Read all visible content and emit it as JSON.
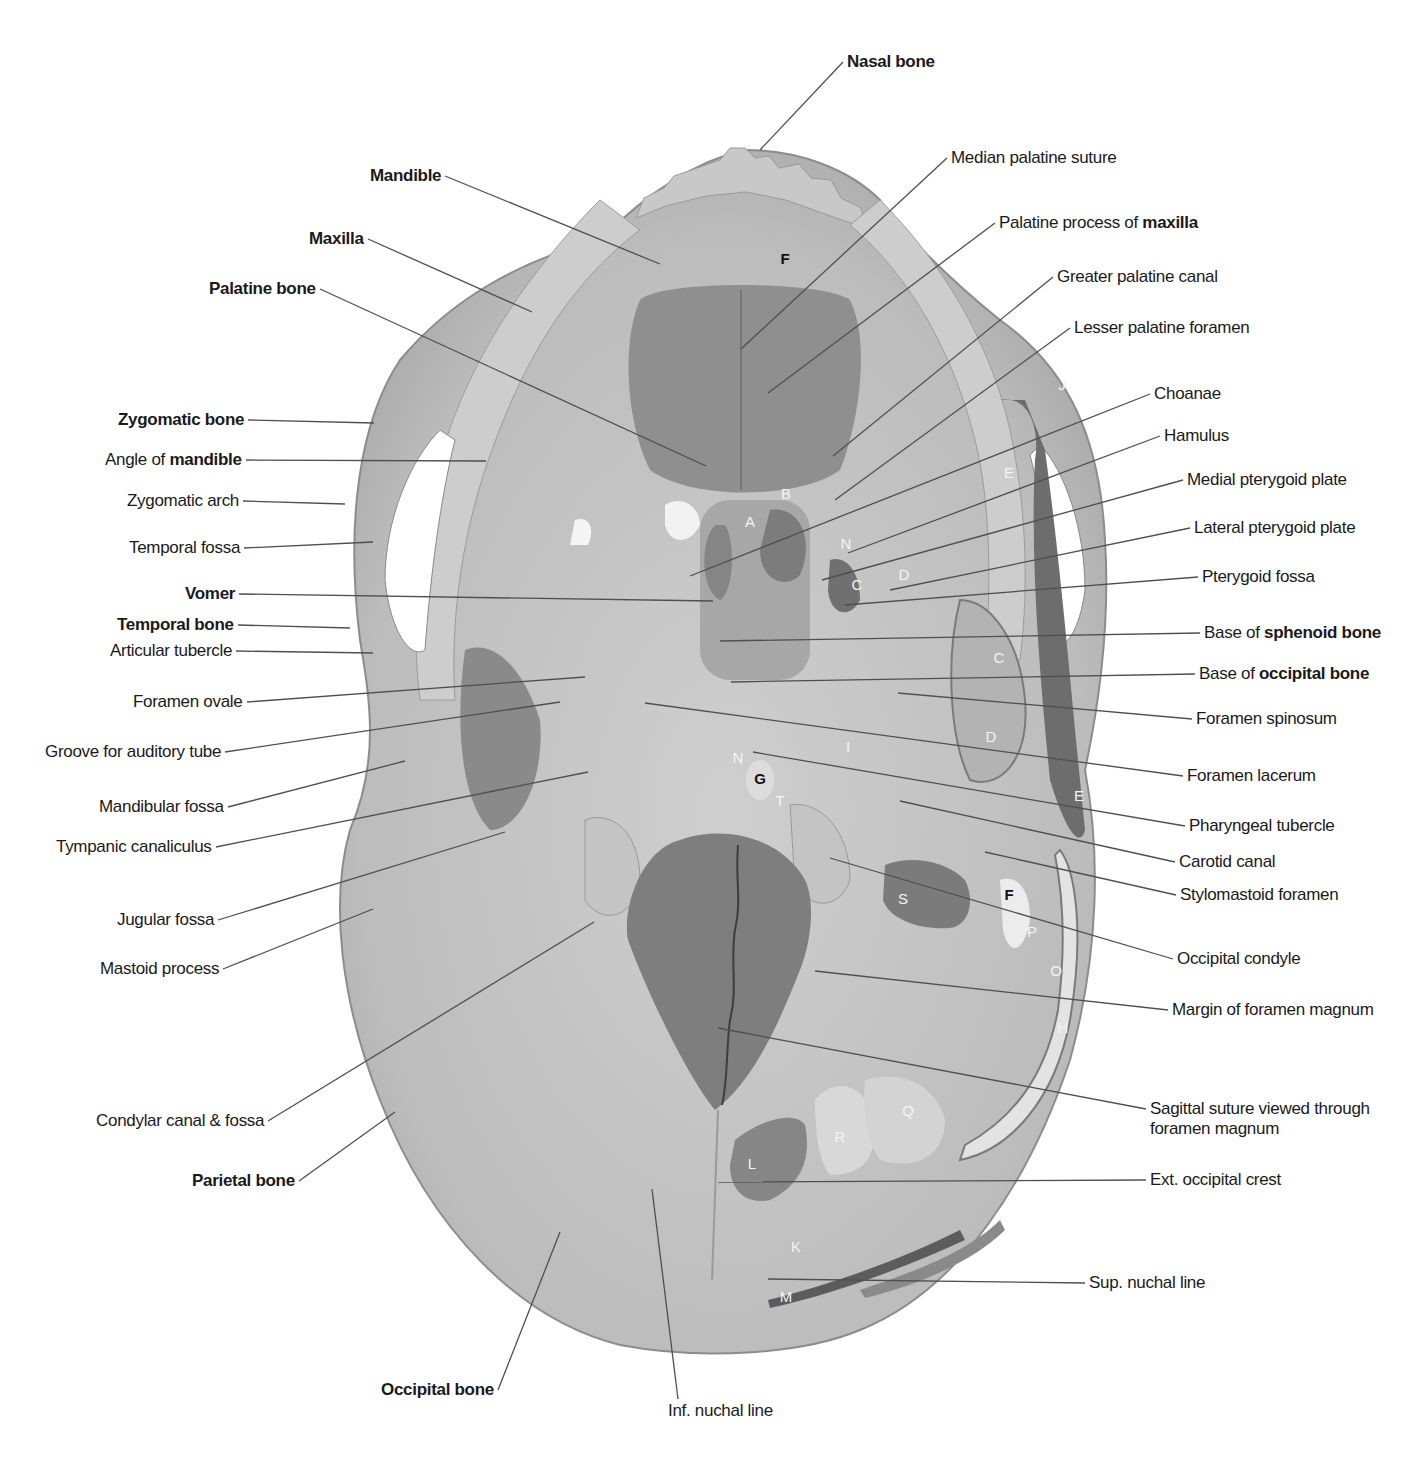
{
  "figure": {
    "colors": {
      "bone": "#bdbdbd",
      "bone_light": "#d2d2d2",
      "shadow": "#8a8a8a",
      "dark_region": "#6e6e6e",
      "leader_line": "#555555"
    }
  },
  "labels_left": [
    {
      "id": "mandible",
      "pre": "",
      "bold": "Mandible",
      "post": "",
      "x": 445,
      "y": 176,
      "tx": 660,
      "ty": 264
    },
    {
      "id": "maxilla",
      "pre": "",
      "bold": "Maxilla",
      "post": "",
      "x": 368,
      "y": 239,
      "tx": 532,
      "ty": 312
    },
    {
      "id": "palatine-bone",
      "pre": "",
      "bold": "Palatine bone",
      "post": "",
      "x": 320,
      "y": 289,
      "tx": 706,
      "ty": 466
    },
    {
      "id": "zygomatic-bone",
      "pre": "",
      "bold": "Zygomatic bone",
      "post": "",
      "x": 248,
      "y": 420,
      "tx": 374,
      "ty": 423
    },
    {
      "id": "angle-of-mandible",
      "pre": "Angle of ",
      "bold": "mandible",
      "post": "",
      "x": 246,
      "y": 460,
      "tx": 486,
      "ty": 461
    },
    {
      "id": "zygomatic-arch",
      "pre": "Zygomatic arch",
      "bold": "",
      "post": "",
      "x": 243,
      "y": 501,
      "tx": 345,
      "ty": 504
    },
    {
      "id": "temporal-fossa",
      "pre": "Temporal fossa",
      "bold": "",
      "post": "",
      "x": 244,
      "y": 548,
      "tx": 373,
      "ty": 542
    },
    {
      "id": "vomer",
      "pre": "",
      "bold": "Vomer",
      "post": "",
      "x": 239,
      "y": 594,
      "tx": 713,
      "ty": 601
    },
    {
      "id": "temporal-bone",
      "pre": "",
      "bold": "Temporal bone",
      "post": "",
      "x": 238,
      "y": 625,
      "tx": 350,
      "ty": 628
    },
    {
      "id": "articular-tubercle",
      "pre": "Articular tubercle",
      "bold": "",
      "post": "",
      "x": 236,
      "y": 651,
      "tx": 373,
      "ty": 653
    },
    {
      "id": "foramen-ovale",
      "pre": "Foramen ovale",
      "bold": "",
      "post": "",
      "x": 247,
      "y": 702,
      "tx": 585,
      "ty": 677
    },
    {
      "id": "groove-auditory-tube",
      "pre": "Groove for auditory tube",
      "bold": "",
      "post": "",
      "x": 225,
      "y": 752,
      "tx": 560,
      "ty": 702
    },
    {
      "id": "mandibular-fossa",
      "pre": "Mandibular fossa",
      "bold": "",
      "post": "",
      "x": 228,
      "y": 807,
      "tx": 405,
      "ty": 761
    },
    {
      "id": "tympanic-canaliculus",
      "pre": "Tympanic canaliculus",
      "bold": "",
      "post": "",
      "x": 216,
      "y": 847,
      "tx": 588,
      "ty": 772
    },
    {
      "id": "jugular-fossa",
      "pre": "Jugular fossa",
      "bold": "",
      "post": "",
      "x": 218,
      "y": 920,
      "tx": 505,
      "ty": 832
    },
    {
      "id": "mastoid-process",
      "pre": "Mastoid process",
      "bold": "",
      "post": "",
      "x": 223,
      "y": 969,
      "tx": 373,
      "ty": 909
    },
    {
      "id": "condylar-canal-fossa",
      "pre": "Condylar canal & fossa",
      "bold": "",
      "post": "",
      "x": 268,
      "y": 1121,
      "tx": 594,
      "ty": 922
    },
    {
      "id": "parietal-bone",
      "pre": "",
      "bold": "Parietal bone",
      "post": "",
      "x": 299,
      "y": 1181,
      "tx": 395,
      "ty": 1112
    },
    {
      "id": "occipital-bone",
      "pre": "",
      "bold": "Occipital bone",
      "post": "",
      "x": 498,
      "y": 1390,
      "tx": 560,
      "ty": 1232
    }
  ],
  "labels_right": [
    {
      "id": "nasal-bone",
      "pre": "",
      "bold": "Nasal bone",
      "post": "",
      "x": 843,
      "y": 62,
      "tx": 760,
      "ty": 150
    },
    {
      "id": "median-palatine-suture",
      "pre": "Median palatine suture",
      "bold": "",
      "post": "",
      "x": 947,
      "y": 158,
      "tx": 741,
      "ty": 349
    },
    {
      "id": "palatine-process-maxilla",
      "pre": "Palatine process of ",
      "bold": "maxilla",
      "post": "",
      "x": 995,
      "y": 223,
      "tx": 768,
      "ty": 393
    },
    {
      "id": "greater-palatine-canal",
      "pre": "Greater palatine canal",
      "bold": "",
      "post": "",
      "x": 1053,
      "y": 277,
      "tx": 833,
      "ty": 456
    },
    {
      "id": "lesser-palatine-foramen",
      "pre": "Lesser palatine foramen",
      "bold": "",
      "post": "",
      "x": 1070,
      "y": 328,
      "tx": 835,
      "ty": 500
    },
    {
      "id": "choanae",
      "pre": "Choanae",
      "bold": "",
      "post": "",
      "x": 1150,
      "y": 394,
      "tx": 690,
      "ty": 576
    },
    {
      "id": "hamulus",
      "pre": "Hamulus",
      "bold": "",
      "post": "",
      "x": 1160,
      "y": 436,
      "tx": 848,
      "ty": 553
    },
    {
      "id": "medial-pterygoid-plate",
      "pre": "Medial pterygoid plate",
      "bold": "",
      "post": "",
      "x": 1183,
      "y": 480,
      "tx": 822,
      "ty": 580
    },
    {
      "id": "lateral-pterygoid-plate",
      "pre": "Lateral pterygoid plate",
      "bold": "",
      "post": "",
      "x": 1190,
      "y": 528,
      "tx": 890,
      "ty": 590
    },
    {
      "id": "pterygoid-fossa",
      "pre": "Pterygoid fossa",
      "bold": "",
      "post": "",
      "x": 1198,
      "y": 577,
      "tx": 845,
      "ty": 605
    },
    {
      "id": "base-sphenoid",
      "pre": "Base of ",
      "bold": "sphenoid bone",
      "post": "",
      "x": 1200,
      "y": 633,
      "tx": 720,
      "ty": 641
    },
    {
      "id": "base-occipital",
      "pre": "Base of ",
      "bold": "occipital bone",
      "post": "",
      "x": 1195,
      "y": 674,
      "tx": 731,
      "ty": 682
    },
    {
      "id": "foramen-spinosum",
      "pre": "Foramen spinosum",
      "bold": "",
      "post": "",
      "x": 1192,
      "y": 719,
      "tx": 898,
      "ty": 693
    },
    {
      "id": "foramen-lacerum",
      "pre": "Foramen lacerum",
      "bold": "",
      "post": "",
      "x": 1183,
      "y": 776,
      "tx": 645,
      "ty": 703
    },
    {
      "id": "pharyngeal-tubercle",
      "pre": "Pharyngeal tubercle",
      "bold": "",
      "post": "",
      "x": 1185,
      "y": 826,
      "tx": 753,
      "ty": 752
    },
    {
      "id": "carotid-canal",
      "pre": "Carotid canal",
      "bold": "",
      "post": "",
      "x": 1175,
      "y": 862,
      "tx": 900,
      "ty": 801
    },
    {
      "id": "stylomastoid-foramen",
      "pre": "Stylomastoid foramen",
      "bold": "",
      "post": "",
      "x": 1176,
      "y": 895,
      "tx": 985,
      "ty": 852
    },
    {
      "id": "occipital-condyle",
      "pre": "Occipital condyle",
      "bold": "",
      "post": "",
      "x": 1173,
      "y": 959,
      "tx": 830,
      "ty": 858
    },
    {
      "id": "margin-foramen-magnum",
      "pre": "Margin of foramen magnum",
      "bold": "",
      "post": "",
      "x": 1168,
      "y": 1010,
      "tx": 815,
      "ty": 971
    },
    {
      "id": "sagittal-suture",
      "pre": "Sagittal suture viewed through",
      "bold": "",
      "post": "foramen magnum",
      "x": 1146,
      "y": 1109,
      "tx": 718,
      "ty": 1028
    },
    {
      "id": "ext-occipital-crest",
      "pre": "Ext. occipital crest",
      "bold": "",
      "post": "",
      "x": 1146,
      "y": 1180,
      "tx": 718,
      "ty": 1182
    },
    {
      "id": "sup-nuchal-line",
      "pre": "Sup. nuchal line",
      "bold": "",
      "post": "",
      "x": 1085,
      "y": 1283,
      "tx": 768,
      "ty": 1279
    }
  ],
  "labels_bottom": [
    {
      "id": "inf-nuchal-line",
      "pre": "Inf. nuchal line",
      "bold": "",
      "post": "",
      "x": 668,
      "y": 1411,
      "tx": 652,
      "ty": 1189
    }
  ],
  "region_letters": [
    {
      "letter": "F",
      "x": 785,
      "y": 258,
      "dark": true
    },
    {
      "letter": "J",
      "x": 1062,
      "y": 384,
      "dark": false
    },
    {
      "letter": "E",
      "x": 1009,
      "y": 472,
      "dark": false
    },
    {
      "letter": "B",
      "x": 786,
      "y": 493,
      "dark": false
    },
    {
      "letter": "A",
      "x": 750,
      "y": 521,
      "dark": false
    },
    {
      "letter": "N",
      "x": 846,
      "y": 543,
      "dark": false
    },
    {
      "letter": "D",
      "x": 904,
      "y": 574,
      "dark": false
    },
    {
      "letter": "C",
      "x": 857,
      "y": 584,
      "dark": false
    },
    {
      "letter": "C",
      "x": 999,
      "y": 657,
      "dark": false
    },
    {
      "letter": "D",
      "x": 991,
      "y": 736,
      "dark": false
    },
    {
      "letter": "I",
      "x": 848,
      "y": 746,
      "dark": false
    },
    {
      "letter": "N",
      "x": 738,
      "y": 757,
      "dark": false
    },
    {
      "letter": "G",
      "x": 760,
      "y": 778,
      "dark": true
    },
    {
      "letter": "T",
      "x": 780,
      "y": 800,
      "dark": false
    },
    {
      "letter": "E",
      "x": 1079,
      "y": 795,
      "dark": false
    },
    {
      "letter": "S",
      "x": 903,
      "y": 898,
      "dark": false
    },
    {
      "letter": "F",
      "x": 1009,
      "y": 894,
      "dark": true
    },
    {
      "letter": "P",
      "x": 1032,
      "y": 931,
      "dark": false
    },
    {
      "letter": "O",
      "x": 1056,
      "y": 970,
      "dark": false
    },
    {
      "letter": "H",
      "x": 1063,
      "y": 1027,
      "dark": false
    },
    {
      "letter": "Q",
      "x": 908,
      "y": 1110,
      "dark": false
    },
    {
      "letter": "R",
      "x": 840,
      "y": 1136,
      "dark": false
    },
    {
      "letter": "L",
      "x": 752,
      "y": 1163,
      "dark": false
    },
    {
      "letter": "K",
      "x": 796,
      "y": 1246,
      "dark": false
    },
    {
      "letter": "M",
      "x": 786,
      "y": 1296,
      "dark": false
    }
  ]
}
